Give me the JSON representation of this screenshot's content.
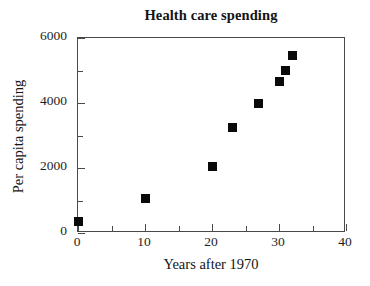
{
  "chart_data": {
    "type": "scatter",
    "title": "Health care spending",
    "xlabel": "Years after 1970",
    "ylabel": "Per capita spending",
    "xlim": [
      0,
      40
    ],
    "ylim": [
      0,
      6000
    ],
    "grid": false,
    "legend": null,
    "x_major_ticks": [
      0,
      10,
      20,
      30,
      40
    ],
    "x_minor_ticks": [
      5,
      15,
      25,
      35
    ],
    "x_tick_labels": [
      "0",
      "10",
      "20",
      "30",
      "40"
    ],
    "y_major_ticks": [
      0,
      2000,
      4000,
      6000
    ],
    "y_minor_ticks": [
      1000,
      3000,
      5000
    ],
    "y_tick_labels": [
      "0",
      "2000",
      "4000",
      "6000"
    ],
    "marker": "filled-square",
    "marker_color": "#0a0a0a",
    "points": [
      {
        "x": 0,
        "y": 350
      },
      {
        "x": 10,
        "y": 1050
      },
      {
        "x": 20,
        "y": 2050
      },
      {
        "x": 23,
        "y": 3250
      },
      {
        "x": 27,
        "y": 4000
      },
      {
        "x": 30,
        "y": 4650
      },
      {
        "x": 31,
        "y": 5000
      },
      {
        "x": 32,
        "y": 5450
      }
    ]
  },
  "style": {
    "axis_color": "#4a4a4a",
    "text_color": "#141414",
    "background": "#ffffff"
  }
}
